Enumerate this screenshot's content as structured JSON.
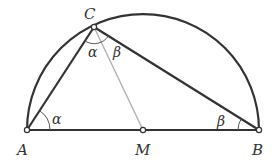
{
  "diagram": {
    "points": {
      "A": {
        "label": "A",
        "x": 27,
        "y": 130
      },
      "M": {
        "label": "M",
        "x": 143,
        "y": 130
      },
      "B": {
        "label": "B",
        "x": 259,
        "y": 130
      },
      "C": {
        "label": "C",
        "x": 94,
        "y": 27
      }
    },
    "angles": {
      "alpha_at_A": "α",
      "alpha_at_C": "α",
      "beta_at_C": "β",
      "beta_at_B": "β"
    },
    "colors": {
      "stroke": "#333333",
      "median": "#b0b0b0",
      "arc_mark": "#555555"
    }
  }
}
